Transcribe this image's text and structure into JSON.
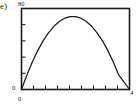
{
  "figure": {
    "panel_label": "(e)",
    "background_color": "#ffffff",
    "line_color": "#1a1a1a",
    "frame_color": "#1a1a1a"
  },
  "chart_data": {
    "type": "line",
    "title": "",
    "subtitle": "",
    "xlabel": "",
    "ylabel": "",
    "xlim": [
      0,
      4
    ],
    "ylim": [
      0,
      80
    ],
    "grid": false,
    "legend": null,
    "legend_position": "none",
    "annotations": [],
    "axis": {
      "x_tick_labels": [
        "0",
        "4"
      ],
      "x_tick_values": [
        0,
        4
      ],
      "x_minor_tick_count": 8,
      "y_tick_labels": [
        "0",
        "80"
      ],
      "y_tick_values": [
        0,
        80
      ],
      "y_minor_tick_count": 4,
      "frame": "box"
    },
    "series": [
      {
        "name": "curve",
        "x": [
          0.0,
          0.2,
          0.4,
          0.6,
          0.8,
          1.0,
          1.2,
          1.4,
          1.6,
          1.8,
          2.0,
          2.2,
          2.4,
          2.6,
          2.8,
          3.0,
          3.2,
          3.4,
          3.6,
          3.8,
          4.0
        ],
        "values": [
          0.0,
          14.4,
          27.2,
          38.4,
          48.0,
          56.0,
          62.4,
          67.2,
          70.4,
          72.0,
          72.0,
          70.4,
          67.2,
          62.4,
          56.0,
          48.0,
          38.4,
          27.2,
          14.4,
          7.2,
          0.0
        ]
      }
    ]
  }
}
